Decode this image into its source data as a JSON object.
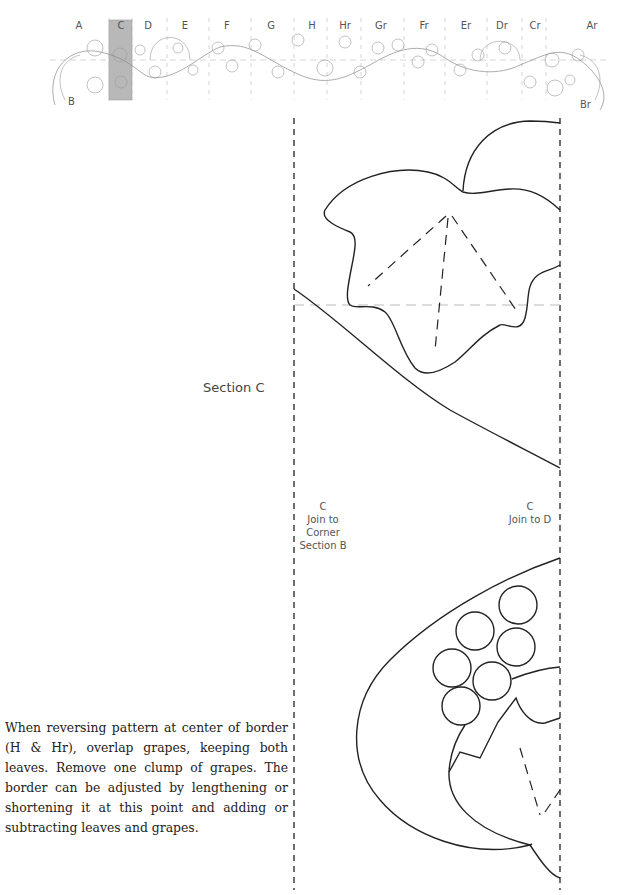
{
  "border_overview": {
    "segments": [
      {
        "label": "A",
        "x": 79
      },
      {
        "label": "C",
        "x": 121,
        "highlighted": true
      },
      {
        "label": "D",
        "x": 148
      },
      {
        "label": "E",
        "x": 185
      },
      {
        "label": "F",
        "x": 227
      },
      {
        "label": "G",
        "x": 271
      },
      {
        "label": "H",
        "x": 312
      },
      {
        "label": "Hr",
        "x": 345
      },
      {
        "label": "Gr",
        "x": 381
      },
      {
        "label": "Fr",
        "x": 424
      },
      {
        "label": "Er",
        "x": 466
      },
      {
        "label": "Dr",
        "x": 502
      },
      {
        "label": "Cr",
        "x": 535
      },
      {
        "label": "Ar",
        "x": 592
      }
    ],
    "corner_labels": [
      {
        "label": "B",
        "x": 68,
        "y": 96
      },
      {
        "label": "Br",
        "x": 580,
        "y": 99
      }
    ],
    "highlight_color": "#b8b8b8"
  },
  "section": {
    "title": "Section C",
    "left_join": {
      "line1": "C",
      "line2": "Join to",
      "line3": "Corner",
      "line4": "Section B"
    },
    "right_join": {
      "line1": "C",
      "line2": "Join to D"
    }
  },
  "instructions": "When reversing pattern at center of border (H & Hr), overlap grapes, keeping both leaves. Remove one clump of grapes. The border can be adjusted by lengthening or shortening it at this point and adding or subtracting leaves and grapes."
}
